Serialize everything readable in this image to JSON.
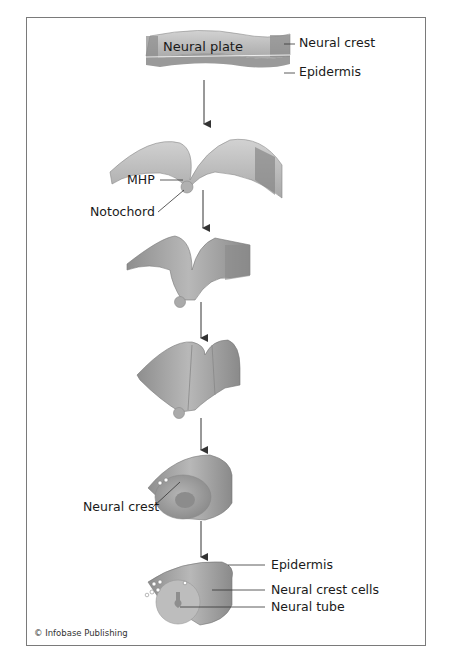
{
  "stages": [
    {
      "id": 1,
      "labels": [
        "Neural plate",
        "Neural crest",
        "Epidermis"
      ]
    },
    {
      "id": 2,
      "labels": [
        "MHP",
        "Notochord"
      ]
    },
    {
      "id": 3,
      "labels": []
    },
    {
      "id": 4,
      "labels": []
    },
    {
      "id": 5,
      "labels": [
        "Neural crest"
      ]
    },
    {
      "id": 6,
      "labels": [
        "Epidermis",
        "Neural crest cells",
        "Neural tube"
      ]
    }
  ],
  "labels": {
    "neural_plate": "Neural plate",
    "neural_crest_top": "Neural crest",
    "epidermis_top": "Epidermis",
    "mhp": "MHP",
    "notochord": "Notochord",
    "neural_crest_mid": "Neural crest",
    "epidermis_bottom": "Epidermis",
    "neural_crest_cells": "Neural crest cells",
    "neural_tube": "Neural tube"
  },
  "credit": "© Infobase Publishing",
  "colors": {
    "tissue_light": "#c4c4c4",
    "tissue_mid": "#9e9e9e",
    "tissue_dark": "#7a7a7a",
    "frame": "#7a7a7a",
    "text": "#1a1a1a"
  }
}
